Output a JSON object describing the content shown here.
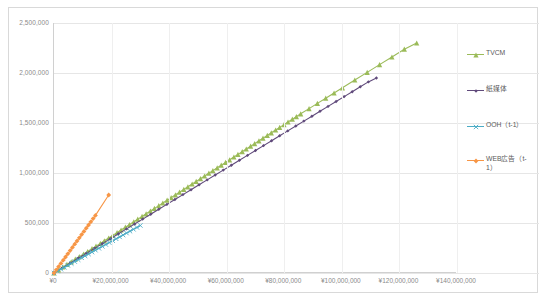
{
  "chart_data": {
    "type": "scatter",
    "title": "",
    "subtitle": "",
    "xlabel": "",
    "ylabel": "",
    "xlim": [
      0,
      140000000
    ],
    "ylim": [
      0,
      2500000
    ],
    "grid": true,
    "legend_position": "right",
    "x_ticks": [
      0,
      20000000,
      40000000,
      60000000,
      80000000,
      100000000,
      120000000,
      140000000
    ],
    "x_tick_labels": [
      "¥0",
      "¥20,000,000",
      "¥40,000,000",
      "¥60,000,000",
      "¥80,000,000",
      "¥100,000,000",
      "¥120,000,000",
      "¥140,000,000"
    ],
    "y_ticks": [
      0,
      500000,
      1000000,
      1500000,
      2000000,
      2500000
    ],
    "y_tick_labels": [
      "0",
      "500,000",
      "1,000,000",
      "1,500,000",
      "2,000,000",
      "2,500,000"
    ],
    "series": [
      {
        "name": "TVCM",
        "color": "#9bbb59",
        "marker": "triangle",
        "points": [
          [
            0,
            0
          ],
          [
            1600000,
            32000
          ],
          [
            3100000,
            60000
          ],
          [
            4500000,
            86000
          ],
          [
            6000000,
            112000
          ],
          [
            7400000,
            138000
          ],
          [
            8800000,
            163000
          ],
          [
            10300000,
            190000
          ],
          [
            11700000,
            215000
          ],
          [
            13200000,
            243000
          ],
          [
            14600000,
            268000
          ],
          [
            16100000,
            296000
          ],
          [
            17500000,
            322000
          ],
          [
            19000000,
            350000
          ],
          [
            20400000,
            376000
          ],
          [
            21900000,
            404000
          ],
          [
            23300000,
            430000
          ],
          [
            24800000,
            458000
          ],
          [
            26200000,
            484000
          ],
          [
            27700000,
            512000
          ],
          [
            29100000,
            538000
          ],
          [
            30600000,
            566000
          ],
          [
            32000000,
            592000
          ],
          [
            33500000,
            620000
          ],
          [
            34900000,
            646000
          ],
          [
            36400000,
            674000
          ],
          [
            37800000,
            700000
          ],
          [
            39300000,
            728000
          ],
          [
            40700000,
            754000
          ],
          [
            42200000,
            782000
          ],
          [
            43600000,
            808000
          ],
          [
            45100000,
            836000
          ],
          [
            46500000,
            862000
          ],
          [
            48000000,
            890000
          ],
          [
            49400000,
            916000
          ],
          [
            50900000,
            944000
          ],
          [
            52300000,
            970000
          ],
          [
            53800000,
            998000
          ],
          [
            55200000,
            1024000
          ],
          [
            56700000,
            1052000
          ],
          [
            58100000,
            1078000
          ],
          [
            59600000,
            1106000
          ],
          [
            61000000,
            1132000
          ],
          [
            62500000,
            1160000
          ],
          [
            63900000,
            1186000
          ],
          [
            65400000,
            1214000
          ],
          [
            66800000,
            1240000
          ],
          [
            68300000,
            1268000
          ],
          [
            69700000,
            1294000
          ],
          [
            71200000,
            1322000
          ],
          [
            72600000,
            1348000
          ],
          [
            74100000,
            1376000
          ],
          [
            75500000,
            1402000
          ],
          [
            77000000,
            1430000
          ],
          [
            78400000,
            1456000
          ],
          [
            79900000,
            1484000
          ],
          [
            81300000,
            1510000
          ],
          [
            82800000,
            1538000
          ],
          [
            84200000,
            1564000
          ],
          [
            85700000,
            1592000
          ],
          [
            88600000,
            1644000
          ],
          [
            91500000,
            1696000
          ],
          [
            94400000,
            1748000
          ],
          [
            97300000,
            1800000
          ],
          [
            100200000,
            1852000
          ],
          [
            104500000,
            1930000
          ],
          [
            108800000,
            2006000
          ],
          [
            113100000,
            2084000
          ],
          [
            117400000,
            2160000
          ],
          [
            121700000,
            2238000
          ],
          [
            126000000,
            2300000
          ]
        ]
      },
      {
        "name": "紙媒体",
        "color": "#604a7b",
        "marker": "diamond-small",
        "points": [
          [
            0,
            0
          ],
          [
            2800000,
            49000
          ],
          [
            5600000,
            98000
          ],
          [
            8400000,
            147000
          ],
          [
            11200000,
            196000
          ],
          [
            14000000,
            245000
          ],
          [
            16800000,
            294000
          ],
          [
            19600000,
            343000
          ],
          [
            22400000,
            392000
          ],
          [
            25200000,
            441000
          ],
          [
            28000000,
            490000
          ],
          [
            30800000,
            539000
          ],
          [
            33600000,
            588000
          ],
          [
            36400000,
            637000
          ],
          [
            39200000,
            686000
          ],
          [
            42000000,
            735000
          ],
          [
            44800000,
            784000
          ],
          [
            47600000,
            833000
          ],
          [
            50400000,
            882000
          ],
          [
            53200000,
            931000
          ],
          [
            56000000,
            980000
          ],
          [
            58800000,
            1029000
          ],
          [
            61600000,
            1078000
          ],
          [
            64400000,
            1127000
          ],
          [
            67200000,
            1176000
          ],
          [
            70000000,
            1225000
          ],
          [
            72800000,
            1274000
          ],
          [
            75600000,
            1323000
          ],
          [
            78400000,
            1372000
          ],
          [
            81200000,
            1421000
          ],
          [
            84000000,
            1470000
          ],
          [
            86800000,
            1519000
          ],
          [
            89600000,
            1568000
          ],
          [
            92400000,
            1617000
          ],
          [
            95200000,
            1666000
          ],
          [
            98000000,
            1715000
          ],
          [
            100800000,
            1764000
          ],
          [
            103600000,
            1813000
          ],
          [
            106400000,
            1862000
          ],
          [
            109200000,
            1911000
          ],
          [
            112000000,
            1950000
          ]
        ]
      },
      {
        "name": "OOH（t-1）",
        "color": "#4bacc6",
        "marker": "x",
        "points": [
          [
            0,
            0
          ],
          [
            1200000,
            19000
          ],
          [
            2400000,
            38000
          ],
          [
            3600000,
            57000
          ],
          [
            4800000,
            76000
          ],
          [
            6000000,
            95000
          ],
          [
            7200000,
            114000
          ],
          [
            8400000,
            133000
          ],
          [
            9600000,
            152000
          ],
          [
            10800000,
            171000
          ],
          [
            12000000,
            190000
          ],
          [
            13200000,
            209000
          ],
          [
            14400000,
            228000
          ],
          [
            15600000,
            247000
          ],
          [
            16800000,
            266000
          ],
          [
            18000000,
            285000
          ],
          [
            19200000,
            304000
          ],
          [
            20400000,
            323000
          ],
          [
            21600000,
            342000
          ],
          [
            22800000,
            361000
          ],
          [
            24000000,
            380000
          ],
          [
            25200000,
            399000
          ],
          [
            26400000,
            418000
          ],
          [
            27600000,
            437000
          ],
          [
            28800000,
            456000
          ],
          [
            30000000,
            475000
          ]
        ]
      },
      {
        "name": "WEB広告（t-1）",
        "color": "#f79646",
        "marker": "diamond",
        "points": [
          [
            0,
            0
          ],
          [
            800000,
            32000
          ],
          [
            1600000,
            64000
          ],
          [
            2400000,
            96000
          ],
          [
            3200000,
            128000
          ],
          [
            4000000,
            160000
          ],
          [
            4800000,
            192000
          ],
          [
            5600000,
            224000
          ],
          [
            6400000,
            256000
          ],
          [
            7200000,
            288000
          ],
          [
            8000000,
            320000
          ],
          [
            8800000,
            352000
          ],
          [
            9600000,
            384000
          ],
          [
            10400000,
            416000
          ],
          [
            11200000,
            448000
          ],
          [
            12000000,
            480000
          ],
          [
            12800000,
            512000
          ],
          [
            13600000,
            544000
          ],
          [
            14400000,
            576000
          ],
          [
            19000000,
            780000
          ]
        ]
      }
    ]
  },
  "legend": {
    "items": [
      {
        "label": "TVCM",
        "color": "#9bbb59"
      },
      {
        "label": "紙媒体",
        "color": "#604a7b"
      },
      {
        "label": "OOH（t-1）",
        "color": "#4bacc6"
      },
      {
        "label": "WEB広告（t-1）",
        "color": "#f79646"
      }
    ]
  }
}
